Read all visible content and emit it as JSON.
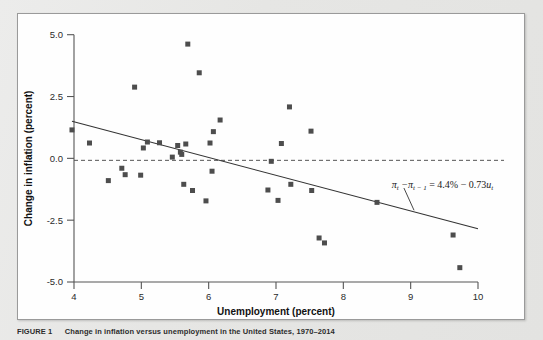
{
  "figure": {
    "caption_label": "FIGURE 1",
    "caption_text": "Change in inflation versus unemployment in the United States, 1970–2014"
  },
  "chart_data": {
    "type": "scatter",
    "title": "",
    "xlabel": "Unemployment (percent)",
    "ylabel": "Change in inflation (percent)",
    "xlim": [
      4,
      10
    ],
    "ylim": [
      -5.0,
      5.0
    ],
    "xticks": [
      "4",
      "5",
      "6",
      "7",
      "8",
      "9",
      "10"
    ],
    "xtick_values": [
      4,
      5,
      6,
      7,
      8,
      9,
      10
    ],
    "yticks": [
      "5.0",
      "2.5",
      "0.0",
      "-2.5",
      "-5.0"
    ],
    "ytick_values": [
      5.0,
      2.5,
      0.0,
      -2.5,
      -5.0
    ],
    "grid": false,
    "legend": "none",
    "marker": {
      "shape": "square",
      "color": "#4d4d4d",
      "size": 5
    },
    "points": [
      {
        "x": 3.97,
        "y": 1.15
      },
      {
        "x": 4.23,
        "y": 0.62
      },
      {
        "x": 4.51,
        "y": -0.9
      },
      {
        "x": 4.71,
        "y": -0.4
      },
      {
        "x": 4.76,
        "y": -0.66
      },
      {
        "x": 4.9,
        "y": 2.88
      },
      {
        "x": 4.99,
        "y": -0.68
      },
      {
        "x": 5.03,
        "y": 0.42
      },
      {
        "x": 5.09,
        "y": 0.66
      },
      {
        "x": 5.27,
        "y": 0.63
      },
      {
        "x": 5.46,
        "y": 0.05
      },
      {
        "x": 5.54,
        "y": 0.52
      },
      {
        "x": 5.58,
        "y": 0.25
      },
      {
        "x": 5.6,
        "y": 0.16
      },
      {
        "x": 5.63,
        "y": -1.05
      },
      {
        "x": 5.66,
        "y": 0.58
      },
      {
        "x": 5.69,
        "y": 4.62
      },
      {
        "x": 5.76,
        "y": -1.3
      },
      {
        "x": 5.86,
        "y": 3.46
      },
      {
        "x": 5.96,
        "y": -1.72
      },
      {
        "x": 6.02,
        "y": 0.62
      },
      {
        "x": 6.05,
        "y": -0.52
      },
      {
        "x": 6.07,
        "y": 1.08
      },
      {
        "x": 6.17,
        "y": 1.55
      },
      {
        "x": 6.88,
        "y": -1.28
      },
      {
        "x": 6.93,
        "y": -0.12
      },
      {
        "x": 7.03,
        "y": -1.7
      },
      {
        "x": 7.08,
        "y": 0.6
      },
      {
        "x": 7.2,
        "y": 2.08
      },
      {
        "x": 7.22,
        "y": -1.05
      },
      {
        "x": 7.52,
        "y": 1.1
      },
      {
        "x": 7.53,
        "y": -1.3
      },
      {
        "x": 7.64,
        "y": -3.22
      },
      {
        "x": 7.72,
        "y": -3.42
      },
      {
        "x": 8.5,
        "y": -1.78
      },
      {
        "x": 9.63,
        "y": -3.1
      },
      {
        "x": 9.73,
        "y": -4.42
      }
    ],
    "fit_line": {
      "label": "regression line",
      "x_start": 3.97,
      "y_start": 1.5,
      "x_end": 10.0,
      "y_end": -2.85,
      "color": "#333333"
    },
    "zero_line": {
      "label": "zero change reference",
      "y": -0.08,
      "style": "dashed",
      "color": "#555555"
    },
    "annotation": {
      "equation_plain": "πt − πt−1 = 4.4% − 0.73ut",
      "pi": "π",
      "sub_t": "t",
      "sub_t_minus_1": "t − 1",
      "minus": "−",
      "equals": "=",
      "intercept": "4.4%",
      "slope_term": "0.73",
      "u": "u",
      "leader_from_x": 8.9,
      "leader_from_y": -1.2,
      "leader_to_x": 9.05,
      "leader_to_y": -2.1
    }
  }
}
